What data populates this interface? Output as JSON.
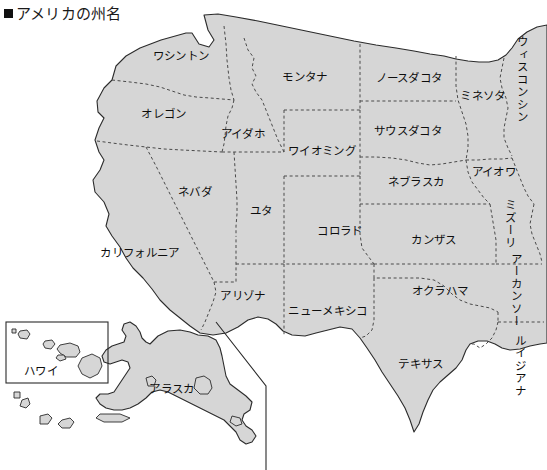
{
  "title": {
    "bullet": "■",
    "text": "アメリカの州名"
  },
  "map": {
    "fill_color": "#d6d6d6",
    "outline_color": "#2b2b2b",
    "border_color": "#4a4a4a",
    "background_color": "#ffffff"
  },
  "inset": {
    "hawaii_box_label": "ハワイ"
  },
  "labels": [
    {
      "name": "washington",
      "text": "ワシントン",
      "x": 181,
      "y": 56,
      "orient": "h"
    },
    {
      "name": "oregon",
      "text": "オレゴン",
      "x": 164,
      "y": 114,
      "orient": "h"
    },
    {
      "name": "idaho",
      "text": "アイダホ",
      "x": 243,
      "y": 134,
      "orient": "h"
    },
    {
      "name": "montana",
      "text": "モンタナ",
      "x": 305,
      "y": 77,
      "orient": "h"
    },
    {
      "name": "north-dakota",
      "text": "ノースダコタ",
      "x": 409,
      "y": 78,
      "orient": "h"
    },
    {
      "name": "minnesota",
      "text": "ミネソタ",
      "x": 483,
      "y": 96,
      "orient": "h"
    },
    {
      "name": "wisconsin",
      "text": "ウィスコンシン",
      "x": 521,
      "y": 80,
      "orient": "v"
    },
    {
      "name": "south-dakota",
      "text": "サウスダコタ",
      "x": 408,
      "y": 131,
      "orient": "h"
    },
    {
      "name": "wyoming",
      "text": "ワイオミング",
      "x": 322,
      "y": 151,
      "orient": "h"
    },
    {
      "name": "nebraska",
      "text": "ネブラスカ",
      "x": 416,
      "y": 182,
      "orient": "h"
    },
    {
      "name": "iowa",
      "text": "アイオワ",
      "x": 494,
      "y": 172,
      "orient": "h"
    },
    {
      "name": "nevada",
      "text": "ネバダ",
      "x": 195,
      "y": 192,
      "orient": "h"
    },
    {
      "name": "utah",
      "text": "ユタ",
      "x": 261,
      "y": 211,
      "orient": "h"
    },
    {
      "name": "colorado",
      "text": "コロラド",
      "x": 340,
      "y": 231,
      "orient": "h"
    },
    {
      "name": "kansas",
      "text": "カンザス",
      "x": 434,
      "y": 240,
      "orient": "h"
    },
    {
      "name": "missouri",
      "text": "ミズーリ",
      "x": 509,
      "y": 224,
      "orient": "v"
    },
    {
      "name": "california",
      "text": "カリフォルニア",
      "x": 140,
      "y": 253,
      "orient": "h"
    },
    {
      "name": "arkansas",
      "text": "アーカンソー",
      "x": 515,
      "y": 290,
      "orient": "v"
    },
    {
      "name": "oklahoma",
      "text": "オクラハマ",
      "x": 440,
      "y": 291,
      "orient": "h"
    },
    {
      "name": "arizona",
      "text": "アリゾナ",
      "x": 243,
      "y": 296,
      "orient": "h"
    },
    {
      "name": "new-mexico",
      "text": "ニューメキシコ",
      "x": 328,
      "y": 311,
      "orient": "h"
    },
    {
      "name": "louisiana",
      "text": "ルイジアナ",
      "x": 519,
      "y": 366,
      "orient": "v"
    },
    {
      "name": "texas",
      "text": "テキサス",
      "x": 421,
      "y": 364,
      "orient": "h"
    },
    {
      "name": "hawaii",
      "text": "ハワイ",
      "x": 41,
      "y": 371,
      "orient": "h"
    },
    {
      "name": "alaska",
      "text": "アラスカ",
      "x": 172,
      "y": 389,
      "orient": "h"
    }
  ]
}
